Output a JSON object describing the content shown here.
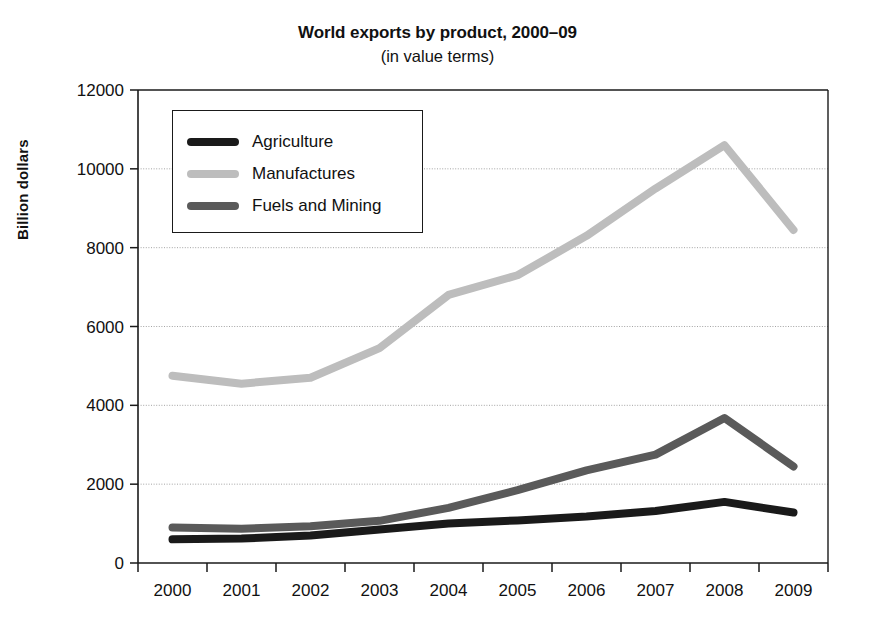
{
  "chart_data": {
    "type": "line",
    "title": "World exports by product, 2000–09",
    "subtitle": "(in value terms)",
    "xlabel": "",
    "ylabel": "Billion dollars",
    "categories": [
      "2000",
      "2001",
      "2002",
      "2003",
      "2004",
      "2005",
      "2006",
      "2007",
      "2008",
      "2009"
    ],
    "x": [
      2000,
      2001,
      2002,
      2003,
      2004,
      2005,
      2006,
      2007,
      2008,
      2009
    ],
    "ylim": [
      0,
      12000
    ],
    "yticks": [
      0,
      2000,
      4000,
      6000,
      8000,
      10000,
      12000
    ],
    "ytick_labels": [
      "0",
      "2000",
      "4000",
      "6000",
      "8000",
      "10000",
      "12000"
    ],
    "grid": true,
    "grid_axis": "y",
    "legend_position": "upper-left-inside",
    "series": [
      {
        "name": "Agriculture",
        "color": "#1a1a1a",
        "values": [
          600,
          620,
          700,
          850,
          1000,
          1080,
          1180,
          1320,
          1550,
          1280
        ]
      },
      {
        "name": "Manufactures",
        "color": "#bdbdbd",
        "values": [
          4750,
          4550,
          4700,
          5450,
          6800,
          7300,
          8300,
          9500,
          10600,
          8450
        ]
      },
      {
        "name": "Fuels and Mining",
        "color": "#5a5a5a",
        "values": [
          900,
          870,
          930,
          1070,
          1400,
          1850,
          2350,
          2750,
          3680,
          2450
        ]
      }
    ]
  },
  "legend": {
    "items": [
      {
        "label": "Agriculture"
      },
      {
        "label": "Manufactures"
      },
      {
        "label": "Fuels and Mining"
      }
    ]
  },
  "colors": {
    "agriculture": "#1a1a1a",
    "manufactures": "#bdbdbd",
    "fuels_and_mining": "#5a5a5a",
    "axis": "#1a1a1a",
    "grid": "#9a9a9a",
    "background": "#ffffff"
  }
}
